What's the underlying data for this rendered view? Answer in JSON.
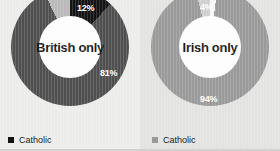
{
  "chart_data": [
    {
      "type": "pie",
      "title": "British only",
      "categories": [
        "Catholic",
        "Other",
        "Protestant"
      ],
      "values": [
        12,
        7,
        81
      ],
      "labels": [
        "12%",
        "",
        "81%"
      ],
      "colors": [
        "#141414",
        "#b9b9b9",
        "#4f4f4f"
      ],
      "legend": [
        {
          "label": "Catholic",
          "color": "#141414"
        }
      ],
      "legend_position": "bottom-left",
      "donut": true
    },
    {
      "type": "pie",
      "title": "Irish only",
      "categories": [
        "Catholic",
        "Other",
        "Protestant"
      ],
      "values": [
        94,
        4,
        2
      ],
      "labels": [
        "94%",
        "4%",
        ""
      ],
      "colors": [
        "#9a9a9a",
        "#cfcfcf",
        "#f7f7f7"
      ],
      "legend": [
        {
          "label": "Catholic",
          "color": "#9a9a9a"
        }
      ],
      "legend_position": "bottom-left",
      "donut": true
    }
  ],
  "left_chart": {
    "center_label": "British only",
    "pct_catholic": "12%",
    "pct_protestant": "81%",
    "legend_label": "Catholic"
  },
  "right_chart": {
    "center_label": "Irish only",
    "pct_catholic": "94%",
    "pct_other": "4%",
    "legend_label": "Catholic"
  }
}
